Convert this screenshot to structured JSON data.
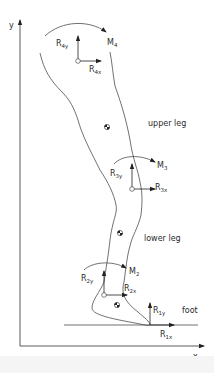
{
  "axes": {
    "x_label": "x",
    "y_label": "y"
  },
  "segments": {
    "upper_leg": "upper leg",
    "lower_leg": "lower leg",
    "foot": "foot"
  },
  "joints": {
    "hip": {
      "moment": "M",
      "moment_sub": "4",
      "rx": "R",
      "rx_sub": "4x",
      "ry": "R",
      "ry_sub": "4y"
    },
    "knee": {
      "moment": "M",
      "moment_sub": "3",
      "rx": "R",
      "rx_sub": "3x",
      "ry": "R",
      "ry_sub": "3y"
    },
    "ankle": {
      "moment": "M",
      "moment_sub": "2",
      "rx": "R",
      "rx_sub": "2x",
      "ry": "R",
      "ry_sub": "2y"
    },
    "ground": {
      "rx": "R",
      "rx_sub": "1x",
      "ry": "R",
      "ry_sub": "1y"
    }
  },
  "colors": {
    "line": "#333333",
    "background": "#ffffff",
    "band": "#f5f5f5"
  }
}
